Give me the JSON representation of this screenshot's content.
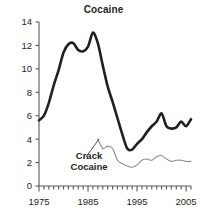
{
  "chart_data": {
    "type": "line",
    "title": "Cocaine",
    "xlabel": "",
    "ylabel": "",
    "xlim": [
      1975,
      2006
    ],
    "ylim": [
      0,
      14
    ],
    "grid": false,
    "legend_position": "inline-annotation",
    "xticks": [
      1975,
      1985,
      1995,
      2005
    ],
    "xtick_labels": [
      "1975",
      "1985",
      "1995",
      "2005"
    ],
    "minor_xtick_interval": 1,
    "yticks": [
      0,
      2,
      4,
      6,
      8,
      10,
      12,
      14
    ],
    "ytick_labels": [
      "0",
      "2",
      "4",
      "6",
      "8",
      "10",
      "12",
      "14"
    ],
    "annotations": [
      {
        "text": "Crack",
        "x": 1985.2,
        "y": 2.3
      },
      {
        "text": "Cocaine",
        "x": 1985.2,
        "y": 1.4
      }
    ],
    "series": [
      {
        "name": "Cocaine",
        "color": "#231f20",
        "line_width": 2.6,
        "x": [
          1975,
          1976,
          1977,
          1978,
          1979,
          1980,
          1981,
          1982,
          1983,
          1984,
          1985,
          1986,
          1987,
          1988,
          1989,
          1990,
          1991,
          1992,
          1993,
          1994,
          1995,
          1996,
          1997,
          1998,
          1999,
          2000,
          2001,
          2002,
          2003,
          2004,
          2005,
          2006
        ],
        "values": [
          5.6,
          6.0,
          7.1,
          8.6,
          9.9,
          11.4,
          12.1,
          12.2,
          11.6,
          11.5,
          11.9,
          13.1,
          12.2,
          10.3,
          8.5,
          7.2,
          5.8,
          4.4,
          3.2,
          3.1,
          3.6,
          4.0,
          4.6,
          5.1,
          5.5,
          6.2,
          5.1,
          4.9,
          5.0,
          5.5,
          5.1,
          5.7
        ]
      },
      {
        "name": "Crack Cocaine",
        "color": "#8c8c8c",
        "line_width": 1.1,
        "x": [
          1987,
          1988,
          1989,
          1990,
          1991,
          1992,
          1993,
          1994,
          1995,
          1996,
          1997,
          1998,
          1999,
          2000,
          2001,
          2002,
          2003,
          2004,
          2005,
          2006
        ],
        "values": [
          4.0,
          3.2,
          3.4,
          3.2,
          2.2,
          1.9,
          1.7,
          1.6,
          1.8,
          2.2,
          2.3,
          2.2,
          2.5,
          2.6,
          2.3,
          2.1,
          2.2,
          2.2,
          2.1,
          2.1
        ]
      }
    ]
  }
}
